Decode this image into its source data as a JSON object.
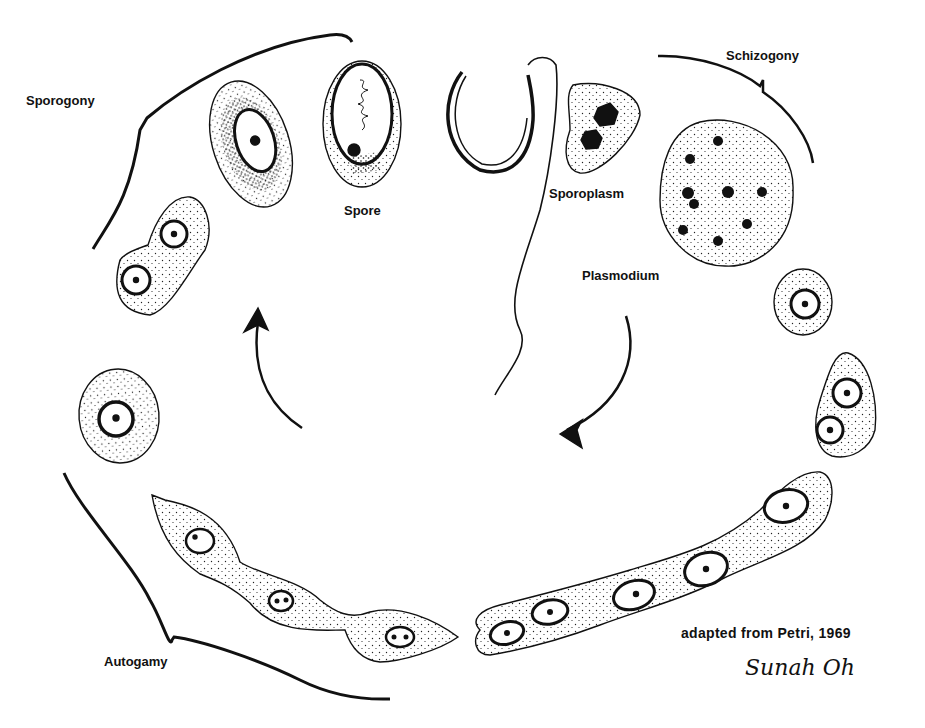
{
  "figure": {
    "type": "life-cycle-illustration",
    "labels": {
      "sporogony": "Sporogony",
      "spore": "Spore",
      "sporoplasm": "Sporoplasm",
      "schizogony": "Schizogony",
      "plasmodium": "Plasmodium",
      "autogamy": "Autogamy"
    },
    "credit": "adapted from  Petri, 1969",
    "signature": "Sunah  Oh",
    "colors": {
      "ink": "#111111",
      "background": "#ffffff"
    }
  }
}
